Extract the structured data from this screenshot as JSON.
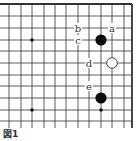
{
  "figure": {
    "caption": "図1"
  },
  "board": {
    "background": "#ffffff",
    "line_color": "#333333",
    "columns_x": [
      9,
      21,
      32,
      44,
      55,
      66,
      78,
      89,
      101,
      112,
      124,
      132
    ],
    "rows_y": [
      4,
      16,
      28,
      40,
      51,
      63,
      75,
      86,
      98,
      110,
      121
    ],
    "edges": {
      "top": true,
      "right": true
    },
    "star_points": [
      {
        "x": 32,
        "y": 40
      },
      {
        "x": 32,
        "y": 110
      },
      {
        "x": 101,
        "y": 110
      }
    ],
    "stones": [
      {
        "color": "black",
        "x": 101,
        "y": 40
      },
      {
        "color": "white",
        "x": 112,
        "y": 63
      },
      {
        "color": "black",
        "x": 101,
        "y": 98
      }
    ],
    "labels": [
      {
        "text": "a",
        "x": 112,
        "y": 28
      },
      {
        "text": "b",
        "x": 78,
        "y": 28
      },
      {
        "text": "c",
        "x": 78,
        "y": 40
      },
      {
        "text": "d",
        "x": 89,
        "y": 63
      },
      {
        "text": "e",
        "x": 89,
        "y": 86
      }
    ]
  }
}
